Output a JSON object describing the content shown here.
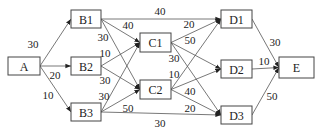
{
  "diagram": {
    "type": "directed-network",
    "nodes": [
      {
        "id": "A",
        "label": "A",
        "x": 8,
        "y": 57,
        "w": 32,
        "h": 18
      },
      {
        "id": "B1",
        "label": "B1",
        "x": 71,
        "y": 10,
        "w": 30,
        "h": 18
      },
      {
        "id": "B2",
        "label": "B2",
        "x": 71,
        "y": 57,
        "w": 30,
        "h": 18
      },
      {
        "id": "B3",
        "label": "B3",
        "x": 71,
        "y": 103,
        "w": 30,
        "h": 18
      },
      {
        "id": "C1",
        "label": "C1",
        "x": 140,
        "y": 33,
        "w": 31,
        "h": 19
      },
      {
        "id": "C2",
        "label": "C2",
        "x": 140,
        "y": 80,
        "w": 31,
        "h": 19
      },
      {
        "id": "D1",
        "label": "D1",
        "x": 221,
        "y": 10,
        "w": 31,
        "h": 18
      },
      {
        "id": "D2",
        "label": "D2",
        "x": 221,
        "y": 60,
        "w": 31,
        "h": 18
      },
      {
        "id": "D3",
        "label": "D3",
        "x": 221,
        "y": 106,
        "w": 31,
        "h": 18
      },
      {
        "id": "E",
        "label": "E",
        "x": 279,
        "y": 57,
        "w": 35,
        "h": 21
      }
    ],
    "edges": [
      {
        "from": "A",
        "to": "B1",
        "weight": "30",
        "lx": 33,
        "ly": 44
      },
      {
        "from": "A",
        "to": "B2",
        "weight": "20",
        "lx": 55,
        "ly": 75
      },
      {
        "from": "A",
        "to": "B3",
        "weight": "10",
        "lx": 48,
        "ly": 95
      },
      {
        "from": "B1",
        "to": "D1",
        "weight": "40",
        "lx": 160,
        "ly": 11
      },
      {
        "from": "B1",
        "to": "C1",
        "weight": "40",
        "lx": 128,
        "ly": 25
      },
      {
        "from": "B1",
        "to": "C2",
        "weight": "30",
        "lx": 103,
        "ly": 37
      },
      {
        "from": "B2",
        "to": "C1",
        "weight": "10",
        "lx": 105,
        "ly": 53
      },
      {
        "from": "B2",
        "to": "C2",
        "weight": "30",
        "lx": 105,
        "ly": 80
      },
      {
        "from": "B3",
        "to": "C1",
        "weight": "30",
        "lx": 104,
        "ly": 96
      },
      {
        "from": "B3",
        "to": "C2",
        "weight": "50",
        "lx": 128,
        "ly": 108
      },
      {
        "from": "B3",
        "to": "D3",
        "weight": "30",
        "lx": 160,
        "ly": 123
      },
      {
        "from": "C1",
        "to": "D1",
        "weight": "20",
        "lx": 189,
        "ly": 24
      },
      {
        "from": "C1",
        "to": "D2",
        "weight": "50",
        "lx": 190,
        "ly": 40
      },
      {
        "from": "C1",
        "to": "D3",
        "weight": "30",
        "lx": 174,
        "ly": 58
      },
      {
        "from": "C2",
        "to": "D1",
        "weight": "10",
        "lx": 174,
        "ly": 74
      },
      {
        "from": "C2",
        "to": "D2",
        "weight": "40",
        "lx": 190,
        "ly": 91
      },
      {
        "from": "C2",
        "to": "D3",
        "weight": "20",
        "lx": 190,
        "ly": 108
      },
      {
        "from": "D1",
        "to": "E",
        "weight": "30",
        "lx": 275,
        "ly": 42
      },
      {
        "from": "D2",
        "to": "E",
        "weight": "10",
        "lx": 264,
        "ly": 61
      },
      {
        "from": "D3",
        "to": "E",
        "weight": "50",
        "lx": 272,
        "ly": 96
      }
    ]
  }
}
